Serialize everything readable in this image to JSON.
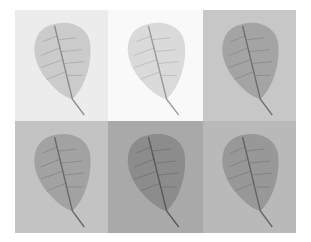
{
  "figure": {
    "grid": {
      "rows": 2,
      "cols": 3
    },
    "panels": [
      {
        "row": 1,
        "col": 1,
        "subject": "leaf",
        "background": "#ececec",
        "leaf": "#c9c9c9",
        "vein": "#8a8a8a"
      },
      {
        "row": 1,
        "col": 2,
        "subject": "leaf",
        "background": "#f9f9f9",
        "leaf": "#d8d8d8",
        "vein": "#9a9a9a"
      },
      {
        "row": 1,
        "col": 3,
        "subject": "leaf",
        "background": "#c7c7c7",
        "leaf": "#a2a2a2",
        "vein": "#6e6e6e"
      },
      {
        "row": 2,
        "col": 1,
        "subject": "leaf",
        "background": "#c3c3c3",
        "leaf": "#a0a0a0",
        "vein": "#6a6a6a"
      },
      {
        "row": 2,
        "col": 2,
        "subject": "leaf",
        "background": "#a9a9a9",
        "leaf": "#8a8a8a",
        "vein": "#5a5a5a"
      },
      {
        "row": 2,
        "col": 3,
        "subject": "leaf",
        "background": "#b9b9b9",
        "leaf": "#969696",
        "vein": "#646464"
      }
    ]
  }
}
